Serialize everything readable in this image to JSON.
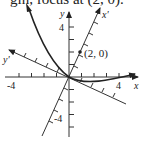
{
  "caption": "gin, focus at (2, 0).",
  "figure": {
    "axes": {
      "x_label": "x",
      "y_label": "y",
      "x_prime_label": "x'",
      "y_prime_label": "y'",
      "x_tick_labels": {
        "neg": "-4",
        "pos": "4"
      },
      "y_tick_labels": {
        "pos": "4",
        "neg": "-4"
      }
    },
    "focus_label": "(2, 0)",
    "colors": {
      "ink": "#222222",
      "background": "#ffffff"
    }
  }
}
